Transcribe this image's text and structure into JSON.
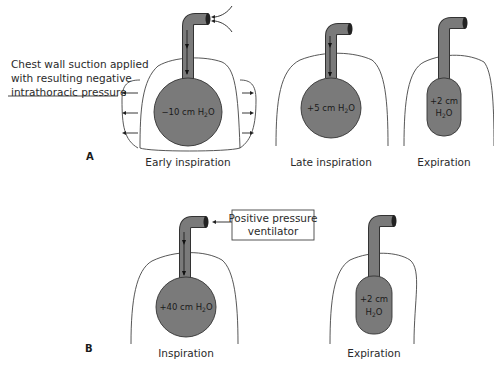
{
  "panel_a": {
    "label": "A",
    "annotation": {
      "line1": "Chest wall suction applied",
      "line2": "with resulting negative",
      "line3": "intrathoracic pressure"
    },
    "stages": [
      {
        "caption": "Early inspiration",
        "pressure_line1": "−10 cm H",
        "pressure_sub": "2",
        "pressure_tail": "O"
      },
      {
        "caption": "Late inspiration",
        "pressure_line1": "+5 cm H",
        "pressure_sub": "2",
        "pressure_tail": "O"
      },
      {
        "caption": "Expiration",
        "pressure_line1": "+2 cm",
        "pressure_line2": "H",
        "pressure_sub": "2",
        "pressure_tail": "O"
      }
    ]
  },
  "panel_b": {
    "label": "B",
    "ventilator_box": {
      "line1": "Positive pressure",
      "line2": "ventilator"
    },
    "stages": [
      {
        "caption": "Inspiration",
        "pressure_line1": "+40 cm H",
        "pressure_sub": "2",
        "pressure_tail": "O"
      },
      {
        "caption": "Expiration",
        "pressure_line1": "+2 cm",
        "pressure_line2": "H",
        "pressure_sub": "2",
        "pressure_tail": "O"
      }
    ]
  },
  "colors": {
    "lung_fill": "#7a7a7a",
    "outline": "#444444",
    "text": "#2a2a2a"
  }
}
